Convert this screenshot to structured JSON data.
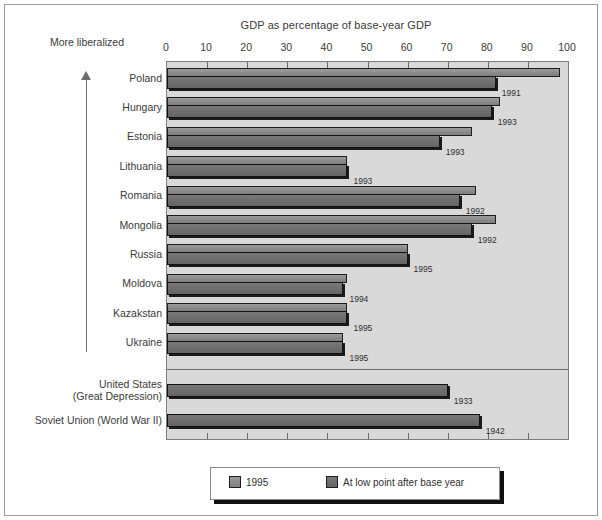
{
  "chart_data": {
    "type": "bar",
    "orientation": "horizontal",
    "title": "GDP as percentage of base-year GDP",
    "xlabel": "",
    "ylabel": "",
    "xlim": [
      0,
      100
    ],
    "xticks": [
      0,
      10,
      20,
      30,
      40,
      50,
      60,
      70,
      80,
      90,
      100
    ],
    "grid": false,
    "legend_position": "bottom",
    "annotation": "More liberalized",
    "annotation_arrow": "up-arrow-icon",
    "series": [
      {
        "name": "1995",
        "values": [
          98,
          83,
          76,
          45,
          77,
          82,
          60,
          45,
          45,
          44,
          null,
          null
        ]
      },
      {
        "name": "At low point after base year",
        "values": [
          82,
          81,
          68,
          45,
          73,
          76,
          60,
          44,
          45,
          44,
          70,
          78
        ]
      }
    ],
    "categories": [
      "Poland",
      "Hungary",
      "Estonia",
      "Lithuania",
      "Romania",
      "Mongolia",
      "Russia",
      "Moldova",
      "Kazakstan",
      "Ukraine",
      "United States\n(Great Depression)",
      "Soviet Union (World War II)"
    ],
    "low_point_years": [
      "1991",
      "1993",
      "1993",
      "1993",
      "1992",
      "1992",
      "1995",
      "1994",
      "1995",
      "1995",
      "1933",
      "1942"
    ],
    "group_break_after_index": 9
  },
  "legend": {
    "items": [
      {
        "label": "1995",
        "swatch": "sw-1995"
      },
      {
        "label": "At low point after base year",
        "swatch": "sw-low"
      }
    ]
  },
  "colors": {
    "plot_background": "#d9d9d9",
    "page_background": "#ffffff",
    "bar_1995": "#8e8e8e",
    "bar_low_point": "#6d6d6d",
    "axis": "#7d7d7d",
    "text": "#3a3a3a"
  }
}
